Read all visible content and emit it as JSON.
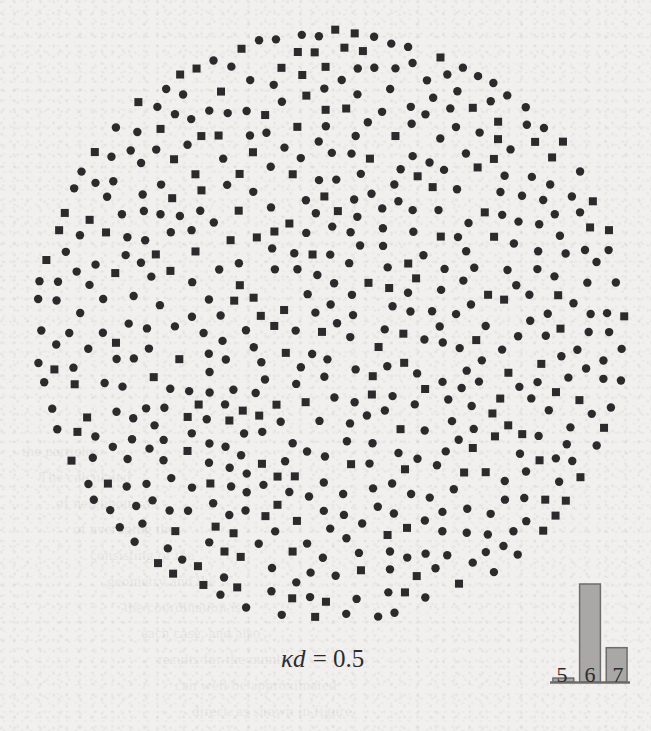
{
  "figure": {
    "type": "scatter-disk-packing",
    "label_kappa": "κ",
    "label_var": "d",
    "label_eq": " = 0.5",
    "label_full": "κd = 0.5",
    "background_color": "#f1f0ee",
    "marker_color": "#2b2a2c"
  },
  "bleed_text": [
    "the particles",
    "The calculated",
    "of neighbours is",
    "of averaging the",
    "consisting of the",
    "geometry and the",
    "the coordination is",
    "each case, and also",
    "results for the number",
    "can well be approximated",
    "direct, as shown in figure",
    "observed in Stoddard's"
  ],
  "chart_data": {
    "type": "scatter",
    "title": "",
    "xlabel": "",
    "ylabel": "",
    "annotation": "κd = 0.5",
    "axis_visible": false,
    "grid": false,
    "legend": null,
    "disk": {
      "cx": 331,
      "cy": 325,
      "r": 296
    },
    "series": [
      {
        "name": "circle-markers",
        "marker": "circle",
        "size_px": 8,
        "color": "#2b2a2c",
        "fraction": 0.7
      },
      {
        "name": "square-markers",
        "marker": "square",
        "size_px": 8,
        "color": "#2b2a2c",
        "fraction": 0.3
      }
    ],
    "n_points": 1040
  },
  "histogram": {
    "type": "bar",
    "categories": [
      "5",
      "6",
      "7"
    ],
    "values": [
      0.04,
      1.0,
      0.35
    ],
    "ylim": [
      0,
      1.05
    ],
    "bar_color": "#a9a8a6",
    "bar_border_color": "#6e6d6b",
    "xlabel": "",
    "ylabel": "",
    "tick_labels": [
      "5",
      "6",
      "7"
    ]
  }
}
